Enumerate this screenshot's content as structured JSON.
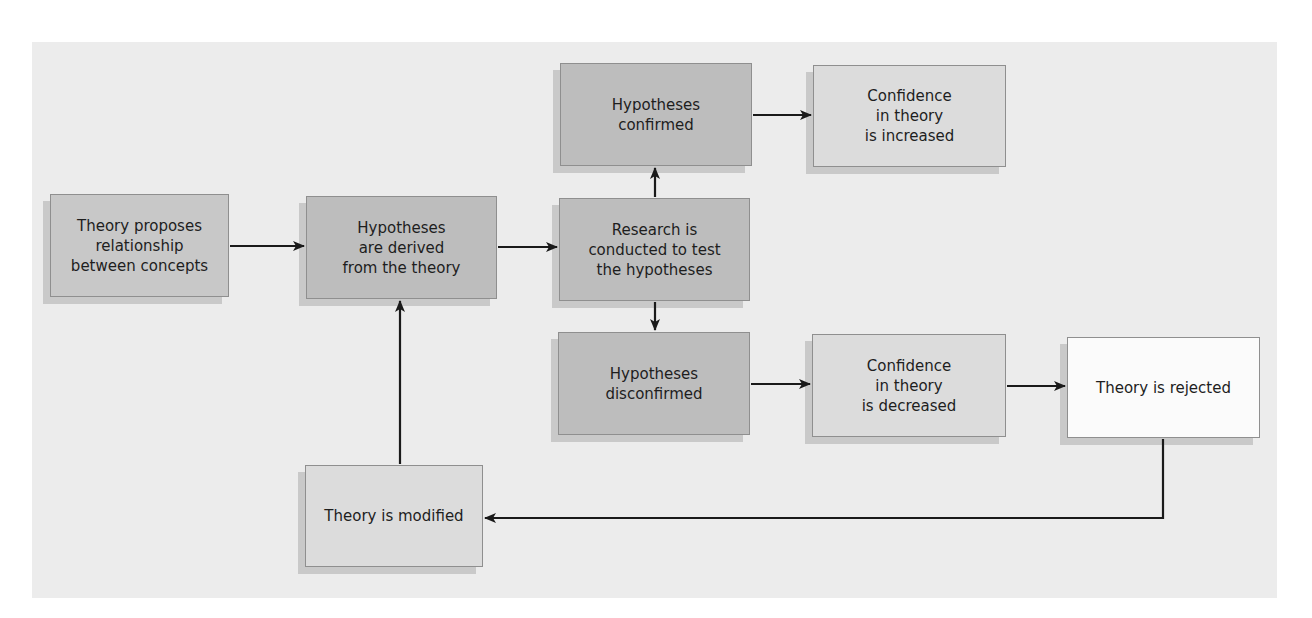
{
  "diagram": {
    "type": "flowchart",
    "nodes": [
      {
        "id": "theory_proposes",
        "label": "Theory proposes relationship between concepts",
        "lines": [
          "Theory proposes",
          "relationship",
          "between concepts"
        ]
      },
      {
        "id": "hypotheses_derived",
        "label": "Hypotheses are derived from the theory",
        "lines": [
          "Hypotheses",
          "are derived",
          "from the theory"
        ]
      },
      {
        "id": "research_conducted",
        "label": "Research is conducted to test the hypotheses",
        "lines": [
          "Research is",
          "conducted to test",
          "the hypotheses"
        ]
      },
      {
        "id": "hypotheses_confirmed",
        "label": "Hypotheses confirmed",
        "lines": [
          "Hypotheses",
          "confirmed"
        ]
      },
      {
        "id": "confidence_increased",
        "label": "Confidence in theory is increased",
        "lines": [
          "Confidence",
          "in theory",
          "is increased"
        ]
      },
      {
        "id": "hypotheses_disconfirmed",
        "label": "Hypotheses disconfirmed",
        "lines": [
          "Hypotheses",
          "disconfirmed"
        ]
      },
      {
        "id": "confidence_decreased",
        "label": "Confidence in theory is decreased",
        "lines": [
          "Confidence",
          "in theory",
          "is decreased"
        ]
      },
      {
        "id": "theory_rejected",
        "label": "Theory is rejected",
        "lines": [
          "Theory is rejected"
        ]
      },
      {
        "id": "theory_modified",
        "label": "Theory is modified",
        "lines": [
          "Theory is modified"
        ]
      }
    ],
    "edges": [
      {
        "from": "theory_proposes",
        "to": "hypotheses_derived"
      },
      {
        "from": "hypotheses_derived",
        "to": "research_conducted"
      },
      {
        "from": "research_conducted",
        "to": "hypotheses_confirmed"
      },
      {
        "from": "research_conducted",
        "to": "hypotheses_disconfirmed"
      },
      {
        "from": "hypotheses_confirmed",
        "to": "confidence_increased"
      },
      {
        "from": "hypotheses_disconfirmed",
        "to": "confidence_decreased"
      },
      {
        "from": "confidence_decreased",
        "to": "theory_rejected"
      },
      {
        "from": "theory_rejected",
        "to": "theory_modified"
      },
      {
        "from": "theory_modified",
        "to": "hypotheses_derived"
      }
    ]
  },
  "colors": {
    "panel_bg": "#ececec",
    "box_dark": "#bdbdbd",
    "box_mid": "#c8c8c8",
    "box_light": "#dcdcdc",
    "box_white": "#fbfbfb",
    "arrow": "#1a1a1a"
  }
}
